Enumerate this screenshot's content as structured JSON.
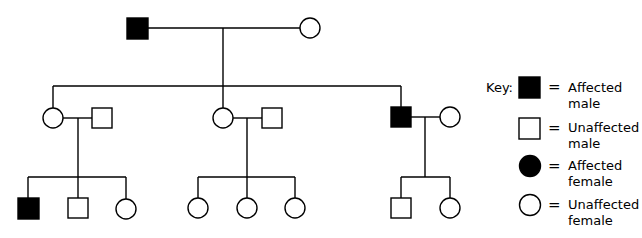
{
  "diagram": {
    "type": "pedigree",
    "colors": {
      "affected": "#000000",
      "unaffected": "#ffffff",
      "line": "#000000"
    },
    "generations": [
      {
        "label": "I",
        "individuals": [
          {
            "id": "I-1",
            "sex": "male",
            "affected": true
          },
          {
            "id": "I-2",
            "sex": "female",
            "affected": false
          }
        ]
      },
      {
        "label": "II",
        "individuals": [
          {
            "id": "II-1",
            "sex": "female",
            "affected": false,
            "spouse": "II-2"
          },
          {
            "id": "II-2",
            "sex": "male",
            "affected": false
          },
          {
            "id": "II-3",
            "sex": "female",
            "affected": false,
            "spouse": "II-4"
          },
          {
            "id": "II-4",
            "sex": "male",
            "affected": false
          },
          {
            "id": "II-5",
            "sex": "male",
            "affected": true,
            "spouse": "II-6"
          },
          {
            "id": "II-6",
            "sex": "female",
            "affected": false
          }
        ]
      },
      {
        "label": "III",
        "individuals": [
          {
            "id": "III-1",
            "sex": "male",
            "affected": true,
            "parents": "II-1/II-2"
          },
          {
            "id": "III-2",
            "sex": "male",
            "affected": false,
            "parents": "II-1/II-2"
          },
          {
            "id": "III-3",
            "sex": "female",
            "affected": false,
            "parents": "II-1/II-2"
          },
          {
            "id": "III-4",
            "sex": "female",
            "affected": false,
            "parents": "II-3/II-4"
          },
          {
            "id": "III-5",
            "sex": "female",
            "affected": false,
            "parents": "II-3/II-4"
          },
          {
            "id": "III-6",
            "sex": "female",
            "affected": false,
            "parents": "II-3/II-4"
          },
          {
            "id": "III-7",
            "sex": "male",
            "affected": false,
            "parents": "II-5/II-6"
          },
          {
            "id": "III-8",
            "sex": "female",
            "affected": false,
            "parents": "II-5/II-6"
          }
        ]
      }
    ]
  },
  "key": {
    "title": "Key:",
    "equals": "=",
    "items": [
      {
        "symbol": "filled-square",
        "line1": "Affected",
        "line2": "male"
      },
      {
        "symbol": "open-square",
        "line1": "Unaffected",
        "line2": "male"
      },
      {
        "symbol": "filled-circle",
        "line1": "Affected",
        "line2": "female"
      },
      {
        "symbol": "open-circle",
        "line1": "Unaffected",
        "line2": "female"
      }
    ]
  }
}
